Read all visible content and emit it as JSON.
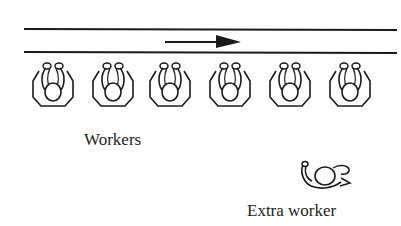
{
  "diagram": {
    "conveyor": {
      "direction": "right",
      "stroke": "#1a1a1a"
    },
    "workers": {
      "count": 6,
      "positions_x": [
        53,
        112,
        170,
        230,
        290,
        350
      ],
      "label": "Workers"
    },
    "extra_worker": {
      "label": "Extra worker"
    }
  }
}
